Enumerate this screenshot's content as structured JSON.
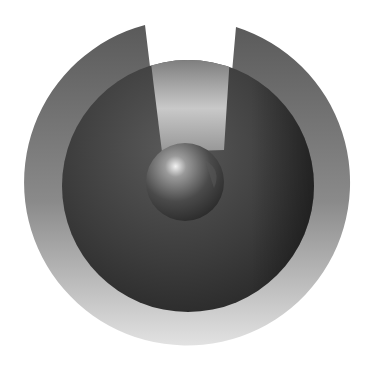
{
  "graphic": {
    "description": "Abstract grayscale emblem: outer notched ring, dark inner sphere, light beam, small central orb",
    "colors": {
      "background": "#ffffff",
      "outer_ring_top": "#5e5e5e",
      "outer_ring_bottom": "#d8d8d8",
      "inner_disk_dark": "#2a2a2a",
      "inner_disk_mid": "#4a4a4a",
      "beam_light": "#e0e0e0",
      "orb_highlight": "#f0f0f0",
      "orb_dark": "#2e2e2e"
    }
  }
}
